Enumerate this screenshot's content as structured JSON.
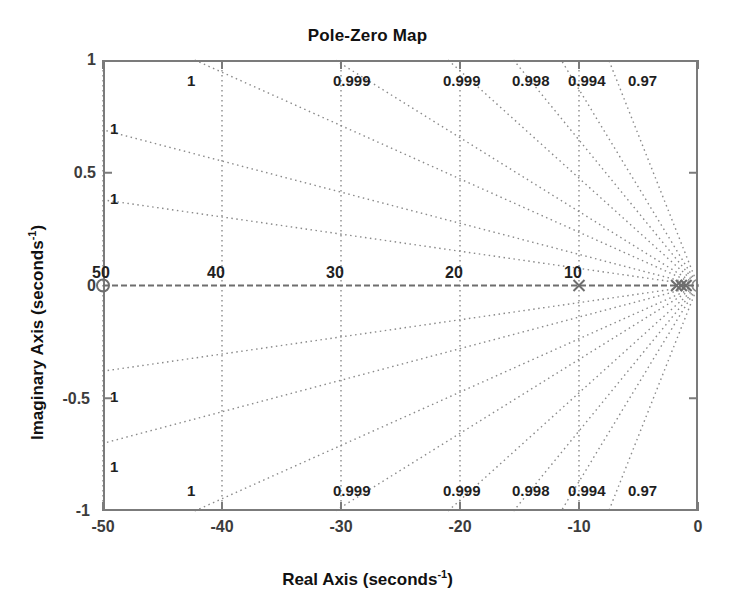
{
  "figure": {
    "title": "Pole-Zero Map",
    "background_color": "#ffffff",
    "box_color": "#7b7b7b",
    "grid_color": "#8a8a8a",
    "marker_color": "#6e6e6e"
  },
  "axes": {
    "x_title_main": "Real Axis (seconds",
    "x_title_sup": "-1",
    "x_title_close": ")",
    "y_title_main": "Imaginary Axis (seconds",
    "y_title_sup": "-1",
    "y_title_close": ")",
    "x_ticks": [
      "-50",
      "-40",
      "-30",
      "-20",
      "-10",
      "0"
    ],
    "y_ticks": [
      "1",
      "0.5",
      "0",
      "-0.5",
      "-1"
    ]
  },
  "chart_data": {
    "type": "scatter",
    "title": "Pole-Zero Map",
    "xlabel": "Real Axis (seconds^-1)",
    "ylabel": "Imaginary Axis (seconds^-1)",
    "xlim": [
      -50,
      0
    ],
    "ylim": [
      -1,
      1
    ],
    "xticks": [
      -50,
      -40,
      -30,
      -20,
      -10,
      0
    ],
    "yticks": [
      -1,
      -0.5,
      0,
      0.5,
      1
    ],
    "grid": "damping-frequency",
    "legend": "none",
    "series": [
      {
        "name": "poles",
        "marker": "x",
        "points": [
          {
            "x": -10,
            "y": 0
          },
          {
            "x": -1.8,
            "y": 0
          },
          {
            "x": -1.4,
            "y": 0
          },
          {
            "x": -1.0,
            "y": 0
          }
        ]
      },
      {
        "name": "zeros",
        "marker": "o",
        "points": [
          {
            "x": -50,
            "y": 0
          }
        ]
      }
    ],
    "damping_ratio_labels_top": [
      "1",
      "0.999",
      "0.999",
      "0.998",
      "0.994",
      "0.97"
    ],
    "damping_ratio_labels_bottom": [
      "1",
      "0.999",
      "0.999",
      "0.998",
      "0.994",
      "0.97"
    ],
    "damping_ratio_labels_left_upper": [
      "1",
      "1"
    ],
    "damping_ratio_labels_left_lower": [
      "1",
      "1"
    ],
    "frequency_labels": [
      "50",
      "40",
      "30",
      "20",
      "10"
    ],
    "damping_line_top_x": [
      -42.3,
      -30.5,
      -21.0,
      -15.5,
      -11.5,
      -7.5
    ],
    "damping_line_left_y": [
      0.69,
      0.38,
      -0.38,
      -0.7
    ],
    "frequency_gridline_x": [
      -50,
      -40,
      -30,
      -20,
      -10
    ]
  },
  "grid_labels": {
    "top": [
      {
        "text": "1",
        "x": 187,
        "y": 72
      },
      {
        "text": "0.999",
        "x": 333,
        "y": 72
      },
      {
        "text": "0.999",
        "x": 443,
        "y": 72
      },
      {
        "text": "0.998",
        "x": 512,
        "y": 72
      },
      {
        "text": "0.994",
        "x": 568,
        "y": 72
      },
      {
        "text": "0.97",
        "x": 628,
        "y": 72
      }
    ],
    "bottom": [
      {
        "text": "1",
        "x": 187,
        "y": 482
      },
      {
        "text": "0.999",
        "x": 333,
        "y": 482
      },
      {
        "text": "0.999",
        "x": 443,
        "y": 482
      },
      {
        "text": "0.998",
        "x": 512,
        "y": 482
      },
      {
        "text": "0.994",
        "x": 568,
        "y": 482
      },
      {
        "text": "0.97",
        "x": 628,
        "y": 482
      }
    ],
    "left": [
      {
        "text": "1",
        "x": 110,
        "y": 120
      },
      {
        "text": "1",
        "x": 110,
        "y": 190
      },
      {
        "text": "1",
        "x": 110,
        "y": 388
      },
      {
        "text": "1",
        "x": 110,
        "y": 458
      }
    ]
  },
  "frequency_labels": [
    {
      "text": "50",
      "x": 92,
      "y": 264
    },
    {
      "text": "40",
      "x": 207,
      "y": 264
    },
    {
      "text": "30",
      "x": 326,
      "y": 264
    },
    {
      "text": "20",
      "x": 445,
      "y": 264
    },
    {
      "text": "10",
      "x": 564,
      "y": 264
    }
  ]
}
